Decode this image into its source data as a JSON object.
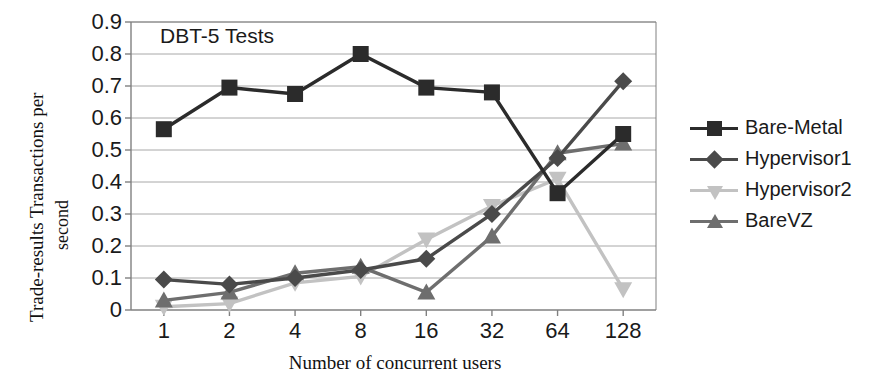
{
  "chart_data": {
    "type": "line",
    "title": "DBT-5 Tests",
    "xlabel": "Number of concurrent users",
    "ylabel_line1": "Trade-results Transactions per",
    "ylabel_line2": "second",
    "categories": [
      "1",
      "2",
      "4",
      "8",
      "16",
      "32",
      "64",
      "128"
    ],
    "ytick_labels": [
      "0.9",
      "0.8",
      "0.7",
      "0.6",
      "0.5",
      "0.4",
      "0.3",
      "0.2",
      "0.1",
      "0"
    ],
    "ytick_values": [
      0.9,
      0.8,
      0.7,
      0.6,
      0.5,
      0.4,
      0.3,
      0.2,
      0.1,
      0
    ],
    "ylim": [
      0,
      0.9
    ],
    "grid": true,
    "legend_position": "right",
    "series": [
      {
        "name": "Bare-Metal",
        "marker": "square",
        "color": "#2b2b2b",
        "values": [
          0.565,
          0.695,
          0.675,
          0.8,
          0.695,
          0.68,
          0.365,
          0.55
        ]
      },
      {
        "name": "Hypervisor1",
        "marker": "diamond",
        "color": "#4a4a4a",
        "values": [
          0.095,
          0.08,
          0.1,
          0.125,
          0.16,
          0.3,
          0.475,
          0.715
        ]
      },
      {
        "name": "Hypervisor2",
        "marker": "triangle-down",
        "color": "#c2c2c2",
        "values": [
          0.01,
          0.02,
          0.085,
          0.105,
          0.22,
          0.325,
          0.41,
          0.065
        ]
      },
      {
        "name": "BareVZ",
        "marker": "triangle-up",
        "color": "#6e6e6e",
        "values": [
          0.03,
          0.055,
          0.115,
          0.135,
          0.055,
          0.23,
          0.49,
          0.52
        ]
      }
    ]
  },
  "colors": {
    "axis": "#808080",
    "grid": "#a8a8a8",
    "frame": "#808080",
    "text": "#1a1a1a"
  }
}
